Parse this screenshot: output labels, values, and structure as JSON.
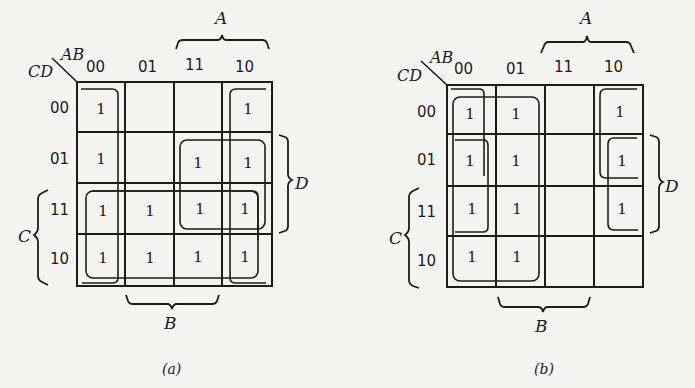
{
  "maps": [
    {
      "id": "a",
      "caption": "(a)",
      "corner_row_var": "CD",
      "corner_col_var": "AB",
      "col_headers": [
        "00",
        "01",
        "11",
        "10"
      ],
      "row_headers": [
        "00",
        "01",
        "11",
        "10"
      ],
      "cells": [
        [
          "1",
          "",
          "",
          "1"
        ],
        [
          "1",
          "",
          "1",
          "1"
        ],
        [
          "1",
          "1",
          "1",
          "1"
        ],
        [
          "1",
          "1",
          "1",
          "1"
        ]
      ],
      "brace_labels": {
        "A": "A",
        "B": "B",
        "C": "C",
        "D": "D"
      }
    },
    {
      "id": "b",
      "caption": "(b)",
      "corner_row_var": "CD",
      "corner_col_var": "AB",
      "col_headers": [
        "00",
        "01",
        "11",
        "10"
      ],
      "row_headers": [
        "00",
        "01",
        "11",
        "10"
      ],
      "cells": [
        [
          "1",
          "1",
          "",
          "1"
        ],
        [
          "1",
          "1",
          "",
          "1"
        ],
        [
          "1",
          "1",
          "",
          "1"
        ],
        [
          "1",
          "1",
          "",
          ""
        ]
      ],
      "brace_labels": {
        "A": "A",
        "B": "B",
        "C": "C",
        "D": "D"
      }
    }
  ]
}
